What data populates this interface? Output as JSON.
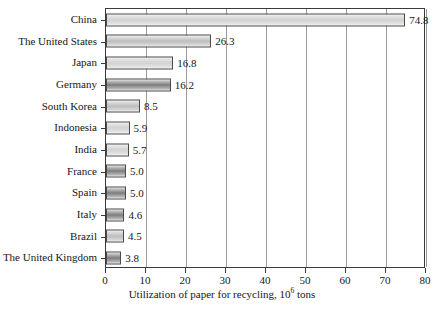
{
  "chart_data": {
    "type": "bar",
    "orientation": "horizontal",
    "title": "",
    "xlabel_prefix": "Utilization of paper for recycling, 10",
    "xlabel_sup": "6",
    "xlabel_suffix": " tons",
    "xlabel_full": "Utilization of paper for recycling, 10^6 tons",
    "ylabel": "",
    "xlim": [
      0,
      80
    ],
    "xticks": [
      0,
      10,
      20,
      30,
      40,
      50,
      60,
      70,
      80
    ],
    "xticklabels": [
      "0",
      "10",
      "20",
      "30",
      "40",
      "50",
      "60",
      "70",
      "80"
    ],
    "grid": true,
    "grid_axis": "x",
    "legend": false,
    "value_labels": true,
    "categories": [
      "China",
      "The United States",
      "Japan",
      "Germany",
      "South Korea",
      "Indonesia",
      "India",
      "France",
      "Spain",
      "Italy",
      "Brazil",
      "The United Kingdom"
    ],
    "values": [
      74.8,
      26.3,
      16.8,
      16.2,
      8.5,
      5.9,
      5.7,
      5.0,
      5.0,
      4.6,
      4.5,
      3.8
    ],
    "value_label_text": [
      "74.8",
      "26.3",
      "16.8",
      "16.2",
      "8.5",
      "5.9",
      "5.7",
      "5.0",
      "5.0",
      "4.6",
      "4.5",
      "3.8"
    ],
    "bar_shades": [
      "light",
      "mid",
      "light",
      "dark",
      "mid",
      "light",
      "light",
      "dark",
      "dark",
      "dark",
      "mid",
      "dark"
    ],
    "colors": {
      "bar_light": "#d2d2d2",
      "bar_mid": "#bdbdbd",
      "bar_dark": "#7d7d7d",
      "bar_border": "#4a4a4a",
      "gridline": "#9a9a9a",
      "axis": "#3a3a3a",
      "text": "#161616",
      "background": "#ffffff"
    }
  }
}
